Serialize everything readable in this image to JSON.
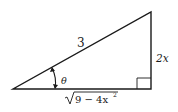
{
  "diagram": {
    "type": "right-triangle",
    "labels": {
      "hypotenuse": "3",
      "opposite": "2x",
      "adjacent_radicand": "9 − 4x",
      "adjacent_exponent": "2",
      "angle": "θ"
    },
    "right_angle_marker": true,
    "colors": {
      "stroke": "#1a1a1a",
      "background": "#ffffff"
    }
  }
}
